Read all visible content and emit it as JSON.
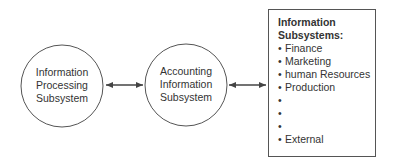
{
  "nodes": [
    {
      "id": "processing",
      "lines": [
        "Information",
        "Processing",
        "Subsystem"
      ]
    },
    {
      "id": "accounting",
      "lines": [
        "Accounting",
        "Information",
        "Subsystem"
      ]
    }
  ],
  "box": {
    "title_lines": [
      "Information",
      "Subsystems:"
    ],
    "items": [
      "Finance",
      "Marketing",
      "human Resources",
      "Production",
      "",
      "",
      "",
      "External"
    ],
    "bullet": "•"
  },
  "edges": [
    {
      "from": "processing",
      "to": "accounting",
      "type": "bidirectional"
    },
    {
      "from": "accounting",
      "to": "box",
      "type": "bidirectional"
    }
  ],
  "colors": {
    "stroke": "#555555",
    "text": "#333333",
    "background": "#ffffff"
  }
}
